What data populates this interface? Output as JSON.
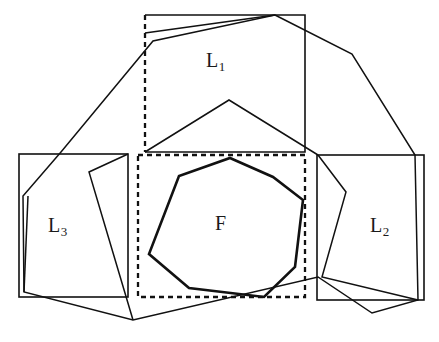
{
  "figure": {
    "caption": "",
    "background_color": "#ffffff",
    "line_color": "#111111",
    "width": 439,
    "height": 342
  },
  "labels": {
    "l1": {
      "base": "L",
      "sub": "1"
    },
    "l2": {
      "base": "L",
      "sub": "2"
    },
    "l3": {
      "base": "L",
      "sub": "3"
    },
    "f": {
      "base": "F",
      "sub": ""
    }
  },
  "chart_data": {
    "type": "diagram",
    "title": "",
    "shapes": [
      {
        "name": "box-l1",
        "label": "L1",
        "style": "solid-rect-with-dashed-left-edge",
        "rect": {
          "x": 145,
          "y": 15,
          "width": 160,
          "height": 137
        },
        "points": [
          [
            145,
            15
          ],
          [
            305,
            15
          ],
          [
            305,
            152
          ],
          [
            145,
            152
          ]
        ]
      },
      {
        "name": "box-l2",
        "label": "L2",
        "style": "solid-rect",
        "rect": {
          "x": 317,
          "y": 155,
          "width": 107,
          "height": 145
        },
        "points": [
          [
            317,
            155
          ],
          [
            424,
            155
          ],
          [
            424,
            300
          ],
          [
            317,
            300
          ]
        ]
      },
      {
        "name": "box-l3",
        "label": "L3",
        "style": "solid-rect",
        "rect": {
          "x": 19,
          "y": 154,
          "width": 109,
          "height": 143
        },
        "points": [
          [
            19,
            154
          ],
          [
            128,
            154
          ],
          [
            128,
            297
          ],
          [
            19,
            297
          ]
        ]
      },
      {
        "name": "bounding-box-f",
        "label": "",
        "style": "dashed-rect",
        "rect": {
          "x": 138,
          "y": 155,
          "width": 167,
          "height": 142
        },
        "points": [
          [
            138,
            155
          ],
          [
            305,
            155
          ],
          [
            305,
            297
          ],
          [
            138,
            297
          ]
        ]
      },
      {
        "name": "polygon-f",
        "label": "F",
        "style": "heavy-closed-polygon",
        "points": [
          [
            230,
            158
          ],
          [
            273,
            177
          ],
          [
            303,
            200
          ],
          [
            295,
            267
          ],
          [
            264,
            297
          ],
          [
            189,
            288
          ],
          [
            149,
            254
          ],
          [
            179,
            176
          ]
        ]
      },
      {
        "name": "outer-polygon-hull",
        "label": "",
        "style": "solid-closed-polygon",
        "points": [
          [
            275,
            15
          ],
          [
            352,
            54
          ],
          [
            415,
            155
          ],
          [
            418,
            300
          ],
          [
            372,
            313
          ],
          [
            318,
            277
          ],
          [
            133,
            320
          ],
          [
            24,
            292
          ],
          [
            23,
            196
          ],
          [
            61,
            152
          ],
          [
            153,
            41
          ]
        ]
      },
      {
        "name": "inner-chain-upper",
        "label": "",
        "style": "solid-open-polyline",
        "points": [
          [
            145,
            33
          ],
          [
            275,
            15
          ]
        ]
      },
      {
        "name": "inner-chain-middle",
        "label": "",
        "style": "solid-open-polyline",
        "points": [
          [
            145,
            152
          ],
          [
            229,
            100
          ],
          [
            318,
            155
          ]
        ]
      },
      {
        "name": "inner-chain-left-wedge",
        "label": "",
        "style": "solid-open-polyline",
        "points": [
          [
            128,
            154
          ],
          [
            89,
            172
          ],
          [
            133,
            320
          ]
        ]
      },
      {
        "name": "inner-chain-right-wedge",
        "label": "",
        "style": "solid-open-polyline",
        "points": [
          [
            318,
            155
          ],
          [
            346,
            192
          ],
          [
            322,
            277
          ],
          [
            418,
            300
          ]
        ]
      },
      {
        "name": "inner-chain-left-spur",
        "label": "",
        "style": "solid-open-polyline",
        "points": [
          [
            24,
            292
          ],
          [
            28,
            196
          ]
        ]
      }
    ],
    "annotations": [
      {
        "name": "label-l1",
        "text": "L1",
        "x": 225,
        "y": 63
      },
      {
        "name": "label-l2",
        "text": "L2",
        "x": 385,
        "y": 228
      },
      {
        "name": "label-l3",
        "text": "L3",
        "x": 65,
        "y": 228
      },
      {
        "name": "label-f",
        "text": "F",
        "x": 222,
        "y": 225
      }
    ]
  }
}
